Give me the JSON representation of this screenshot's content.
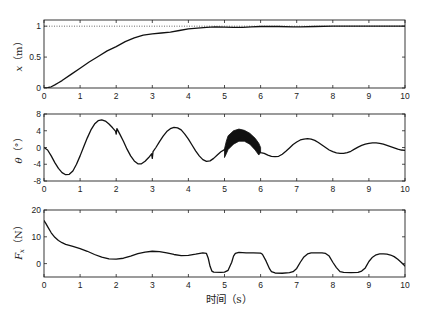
{
  "figure": {
    "xlabel": "时间（s）"
  },
  "chart_data": [
    {
      "type": "line",
      "title": "",
      "ylabel_var": "x",
      "ylabel_sub": "",
      "ylabel_unit": "（m）",
      "xlabel": "",
      "xlim": [
        0,
        10
      ],
      "ylim": [
        0,
        1.1
      ],
      "xticks": [
        0,
        1,
        2,
        3,
        4,
        5,
        6,
        7,
        8,
        9,
        10
      ],
      "xtick_labels": [
        "0",
        "1",
        "2",
        "3",
        "4",
        "5",
        "6",
        "7",
        "8",
        "9",
        "10"
      ],
      "yticks": [
        0,
        0.5,
        1
      ],
      "ytick_labels": [
        "0",
        "0.5",
        "1"
      ],
      "grid": false,
      "reference_lines": [
        {
          "y": 1,
          "style": "dotted",
          "color": "#444444"
        }
      ],
      "series": [
        {
          "name": "x",
          "color": "#111111",
          "x": [
            0,
            0.1,
            0.2,
            0.3,
            0.4,
            0.5,
            0.75,
            1.0,
            1.25,
            1.5,
            1.75,
            2.0,
            2.25,
            2.5,
            2.75,
            3.0,
            3.25,
            3.5,
            3.75,
            4.0,
            4.25,
            4.5,
            4.75,
            5.0,
            5.25,
            5.5,
            5.75,
            6.0,
            6.5,
            6.9,
            7.1,
            7.5,
            8.0,
            9.0,
            10.0
          ],
          "y": [
            0,
            0.005,
            0.02,
            0.05,
            0.085,
            0.12,
            0.22,
            0.32,
            0.42,
            0.51,
            0.6,
            0.67,
            0.75,
            0.81,
            0.855,
            0.875,
            0.89,
            0.905,
            0.93,
            0.955,
            0.97,
            0.98,
            0.99,
            0.985,
            0.98,
            0.98,
            0.99,
            0.995,
            0.995,
            0.99,
            0.99,
            0.995,
            1.0,
            1.0,
            1.0
          ]
        }
      ]
    },
    {
      "type": "line",
      "title": "",
      "ylabel_var": "θ",
      "ylabel_sub": "",
      "ylabel_unit": "（°）",
      "xlabel": "",
      "xlim": [
        0,
        10
      ],
      "ylim": [
        -8,
        8
      ],
      "xticks": [
        0,
        1,
        2,
        3,
        4,
        5,
        6,
        7,
        8,
        9,
        10
      ],
      "xtick_labels": [
        "0",
        "1",
        "2",
        "3",
        "4",
        "5",
        "6",
        "7",
        "8",
        "9",
        "10"
      ],
      "yticks": [
        -8,
        -4,
        0,
        4,
        8
      ],
      "ytick_labels": [
        "-8",
        "-4",
        "0",
        "4",
        "8"
      ],
      "grid": false,
      "series": [
        {
          "name": "theta",
          "color": "#111111",
          "x": [
            0,
            0.1,
            0.2,
            0.3,
            0.4,
            0.5,
            0.6,
            0.7,
            0.8,
            0.9,
            1.0,
            1.1,
            1.2,
            1.3,
            1.4,
            1.5,
            1.6,
            1.7,
            1.8,
            1.9,
            1.98,
            2.0,
            2.02,
            2.1,
            2.2,
            2.3,
            2.4,
            2.5,
            2.6,
            2.7,
            2.8,
            2.9,
            2.98,
            3.0,
            3.02,
            3.1,
            3.2,
            3.3,
            3.4,
            3.5,
            3.6,
            3.7,
            3.8,
            3.9,
            4.0,
            4.1,
            4.2,
            4.3,
            4.4,
            4.5,
            4.6,
            4.7,
            4.8,
            4.9,
            5.0,
            5.5,
            6.0,
            6.1,
            6.2,
            6.3,
            6.4,
            6.5,
            6.6,
            6.7,
            6.8,
            6.9,
            7.0,
            7.1,
            7.2,
            7.3,
            7.4,
            7.5,
            7.6,
            7.7,
            7.8,
            7.9,
            8.0,
            8.1,
            8.2,
            8.3,
            8.4,
            8.5,
            8.6,
            8.7,
            8.8,
            8.9,
            9.0,
            9.1,
            9.2,
            9.3,
            9.4,
            9.5,
            9.6,
            9.7,
            9.8,
            9.9,
            10.0
          ],
          "y": [
            0,
            -0.6,
            -2.0,
            -3.6,
            -5.0,
            -6.0,
            -6.5,
            -6.4,
            -5.6,
            -4.0,
            -2.0,
            0.2,
            2.3,
            4.2,
            5.6,
            6.4,
            6.6,
            6.3,
            5.6,
            4.7,
            3.9,
            3.2,
            4.5,
            3.2,
            1.5,
            -0.4,
            -2.0,
            -3.2,
            -3.9,
            -3.9,
            -3.3,
            -2.4,
            -1.5,
            -2.6,
            -1.0,
            0.0,
            1.4,
            2.7,
            3.8,
            4.5,
            4.8,
            4.7,
            4.2,
            3.2,
            2.0,
            0.6,
            -0.8,
            -2.0,
            -2.9,
            -3.3,
            -3.2,
            -2.6,
            -1.8,
            -1.0,
            -0.5,
            2.8,
            -1.2,
            -1.4,
            -1.8,
            -2.1,
            -2.2,
            -2.1,
            -1.6,
            -0.9,
            -0.1,
            0.7,
            1.3,
            1.8,
            2.0,
            2.1,
            2.0,
            1.7,
            1.2,
            0.6,
            0.0,
            -0.6,
            -1.0,
            -1.3,
            -1.4,
            -1.4,
            -1.2,
            -0.9,
            -0.4,
            0.1,
            0.5,
            0.8,
            1.0,
            1.1,
            1.1,
            1.0,
            0.8,
            0.5,
            0.2,
            -0.1,
            -0.4,
            -0.6,
            -0.7
          ]
        }
      ],
      "band": {
        "name": "high-frequency oscillation",
        "color": "#111111",
        "x": [
          5.0,
          5.05,
          5.1,
          5.25,
          5.4,
          5.55,
          5.7,
          5.85,
          5.95,
          6.0
        ],
        "upper": [
          -0.3,
          1.5,
          2.8,
          4.0,
          4.4,
          4.1,
          3.4,
          2.2,
          1.0,
          0.0
        ],
        "lower": [
          -2.4,
          -1.5,
          -0.5,
          0.8,
          1.5,
          1.5,
          0.8,
          -0.6,
          -1.8,
          -1.2
        ]
      }
    },
    {
      "type": "line",
      "title": "",
      "ylabel_var": "F",
      "ylabel_sub": "x",
      "ylabel_unit": "（N）",
      "xlabel": "时间（s）",
      "xlim": [
        0,
        10
      ],
      "ylim": [
        -5,
        20
      ],
      "xticks": [
        0,
        1,
        2,
        3,
        4,
        5,
        6,
        7,
        8,
        9,
        10
      ],
      "xtick_labels": [
        "0",
        "1",
        "2",
        "3",
        "4",
        "5",
        "6",
        "7",
        "8",
        "9",
        "10"
      ],
      "yticks": [
        0,
        10,
        20
      ],
      "ytick_labels": [
        "0",
        "10",
        "20"
      ],
      "grid": false,
      "series": [
        {
          "name": "Fx",
          "color": "#111111",
          "x": [
            0,
            0.05,
            0.1,
            0.2,
            0.3,
            0.4,
            0.5,
            0.6,
            0.8,
            1.0,
            1.2,
            1.4,
            1.6,
            1.8,
            2.0,
            2.2,
            2.4,
            2.6,
            2.8,
            3.0,
            3.2,
            3.4,
            3.6,
            3.8,
            4.0,
            4.2,
            4.4,
            4.5,
            4.55,
            4.6,
            4.65,
            4.7,
            4.9,
            5.0,
            5.1,
            5.2,
            5.25,
            5.3,
            5.4,
            5.6,
            5.8,
            6.0,
            6.05,
            6.15,
            6.25,
            6.3,
            6.4,
            6.6,
            6.8,
            6.9,
            7.0,
            7.1,
            7.2,
            7.3,
            7.4,
            7.7,
            7.8,
            7.9,
            8.0,
            8.1,
            8.2,
            8.3,
            8.5,
            8.7,
            8.8,
            8.9,
            9.0,
            9.1,
            9.2,
            9.3,
            9.4,
            9.5,
            9.6,
            9.7,
            9.8,
            9.9,
            10.0
          ],
          "y": [
            16,
            15,
            13.8,
            11.5,
            9.8,
            8.6,
            7.8,
            7.2,
            6.4,
            5.6,
            4.6,
            3.4,
            2.4,
            1.8,
            1.7,
            2.0,
            2.8,
            3.7,
            4.3,
            4.6,
            4.5,
            4.0,
            3.4,
            3.0,
            3.1,
            3.5,
            4.0,
            3.8,
            2.0,
            -1.0,
            -2.8,
            -3.2,
            -3.3,
            -3.2,
            -2.5,
            0.5,
            2.8,
            3.8,
            4.2,
            4.0,
            4.0,
            3.9,
            3.5,
            1.0,
            -2.0,
            -3.0,
            -3.5,
            -3.6,
            -3.4,
            -3.0,
            -1.8,
            0.5,
            2.5,
            3.6,
            4.0,
            4.0,
            3.8,
            2.8,
            0.5,
            -1.5,
            -3.0,
            -3.3,
            -3.4,
            -3.3,
            -2.8,
            -1.6,
            0.8,
            2.4,
            3.3,
            3.6,
            3.6,
            3.5,
            3.2,
            2.6,
            1.6,
            0.4,
            -0.9
          ]
        }
      ]
    }
  ]
}
